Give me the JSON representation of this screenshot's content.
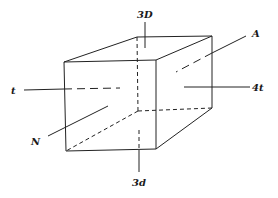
{
  "diagram": {
    "type": "rectangular-box-crystal-axes",
    "labels": {
      "top": "3D",
      "bottom": "3d",
      "left": "t",
      "right": "4t",
      "front_left": "N",
      "back_right": "A"
    },
    "colors": {
      "line": "#222222",
      "background": "#ffffff"
    }
  }
}
